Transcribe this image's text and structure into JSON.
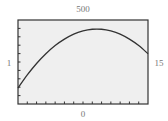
{
  "chart_data": {
    "type": "line",
    "title": "",
    "xlabel": "",
    "ylabel": "",
    "xlim": [
      1,
      15
    ],
    "ylim": [
      0,
      500
    ],
    "window_labels": {
      "ymax": "500",
      "ymin": "0",
      "xmin": "1",
      "xmax": "15"
    },
    "x_tick_step": 1,
    "y_tick_step": 50,
    "grid": false,
    "series": [
      {
        "name": "curve",
        "x": [
          1,
          2,
          3,
          4,
          5,
          6,
          7,
          8,
          9,
          10,
          11,
          12,
          13,
          14,
          15
        ],
        "values": [
          95,
          173,
          241,
          299,
          348,
          386,
          416,
          435,
          445,
          445,
          435,
          416,
          386,
          348,
          299
        ]
      }
    ],
    "colors": {
      "plot_background": "#efefef",
      "frame": "#333333",
      "curve": "#333333",
      "labels": "#777777"
    }
  }
}
